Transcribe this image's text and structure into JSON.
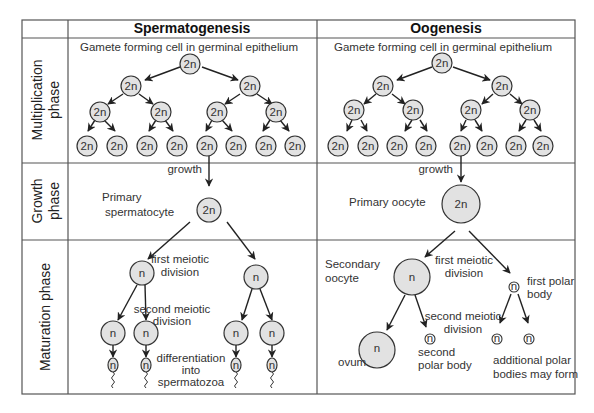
{
  "headers": {
    "spermatogenesis": "Spermatogenesis",
    "oogenesis": "Oogenesis"
  },
  "phases": {
    "multiplication": [
      "Multiplication",
      "phase"
    ],
    "growth": [
      "Growth",
      "phase"
    ],
    "maturation": "Maturation phase"
  },
  "spermatogenesis": {
    "origin_label": "Gamete forming cell in germinal epithelium",
    "diploid_label": "2n",
    "haploid_label": "n",
    "growth_label": "growth",
    "primary_label": [
      "Primary",
      "spermatocyte"
    ],
    "first_division_label": [
      "first meiotic",
      "division"
    ],
    "second_division_label": [
      "second meiotic",
      "division"
    ],
    "differentiation_label": [
      "differentiation",
      "into",
      "spermatozoa"
    ]
  },
  "oogenesis": {
    "origin_label": "Gamete forming cell in germinal epithelium",
    "diploid_label": "2n",
    "haploid_label": "n",
    "growth_label": "growth",
    "primary_label": "Primary oocyte",
    "secondary_label": [
      "Secondary",
      "oocyte"
    ],
    "first_division_label": [
      "first meiotic",
      "division"
    ],
    "first_polar_label": [
      "first polar",
      "body"
    ],
    "second_division_label": [
      "second meiotic",
      "division"
    ],
    "ovum_label": "ovum",
    "second_polar_label": [
      "second",
      "polar body"
    ],
    "additional_polar_label": [
      "additional polar",
      "bodies may form"
    ]
  }
}
